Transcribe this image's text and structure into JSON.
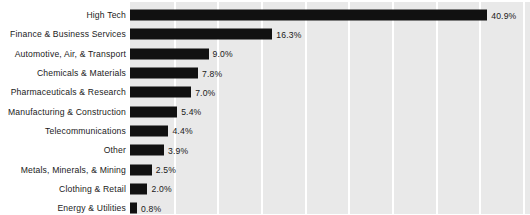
{
  "chart_data": {
    "type": "bar",
    "orientation": "horizontal",
    "title": "",
    "subtitle": "",
    "xlabel": "",
    "ylabel": "",
    "xlim": [
      0,
      45.8
    ],
    "grid": true,
    "grid_axis": "x",
    "grid_step": 5,
    "legend": "none",
    "value_suffix": "%",
    "bar_color": "#111111",
    "plot_background": "#e9e9e9",
    "gridline_color": "#ffffff",
    "label_color": "#1a1a1a",
    "categories": [
      "High Tech",
      "Finance & Business Services",
      "Automotive, Air, & Transport",
      "Chemicals & Materials",
      "Pharmaceuticals & Research",
      "Manufacturing & Construction",
      "Telecommunications",
      "Other",
      "Metals, Minerals, & Mining",
      "Clothing & Retail",
      "Energy & Utilities"
    ],
    "values": [
      40.9,
      16.3,
      9.0,
      7.8,
      7.0,
      5.4,
      4.4,
      3.9,
      2.5,
      2.0,
      0.8
    ],
    "value_labels": [
      "40.9%",
      "16.3%",
      "9.0%",
      "7.8%",
      "7.0%",
      "5.4%",
      "4.4%",
      "3.9%",
      "2.5%",
      "2.0%",
      "0.8%"
    ],
    "rows": [
      {
        "label": "High Tech",
        "value": 40.9,
        "value_label": "40.9%"
      },
      {
        "label": "Finance & Business Services",
        "value": 16.3,
        "value_label": "16.3%"
      },
      {
        "label": "Automotive, Air, & Transport",
        "value": 9.0,
        "value_label": "9.0%"
      },
      {
        "label": "Chemicals & Materials",
        "value": 7.8,
        "value_label": "7.8%"
      },
      {
        "label": "Pharmaceuticals & Research",
        "value": 7.0,
        "value_label": "7.0%"
      },
      {
        "label": "Manufacturing & Construction",
        "value": 5.4,
        "value_label": "5.4%"
      },
      {
        "label": "Telecommunications",
        "value": 4.4,
        "value_label": "4.4%"
      },
      {
        "label": "Other",
        "value": 3.9,
        "value_label": "3.9%"
      },
      {
        "label": "Metals, Minerals, & Mining",
        "value": 2.5,
        "value_label": "2.5%"
      },
      {
        "label": "Clothing & Retail",
        "value": 2.0,
        "value_label": "2.0%"
      },
      {
        "label": "Energy & Utilities",
        "value": 0.8,
        "value_label": "0.8%"
      }
    ],
    "gridlines": [
      5,
      10,
      15,
      20,
      25,
      30,
      35,
      40,
      45
    ]
  }
}
